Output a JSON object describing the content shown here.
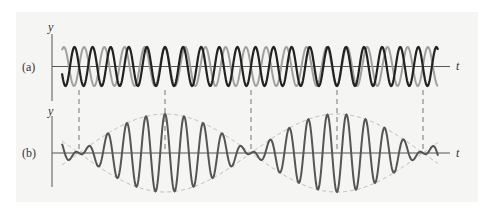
{
  "figure": {
    "panel_a": {
      "label": "(a)",
      "y_axis_label": "y",
      "x_axis_label": "t",
      "description": "Two sinusoidal waves of slightly different frequencies superposed",
      "wave_colors": {
        "wave_1": "#222222",
        "wave_2": "#a0a0a0"
      }
    },
    "panel_b": {
      "label": "(b)",
      "y_axis_label": "y",
      "x_axis_label": "t",
      "description": "Resultant wave showing beats with dashed envelope",
      "wave_color": "#555555",
      "envelope_color": "#b8b8b8"
    },
    "beat_markers": {
      "count": 5,
      "phase_pattern": [
        "out-of-phase",
        "in-phase",
        "out-of-phase",
        "in-phase",
        "out-of-phase"
      ]
    },
    "oscillations_per_beat": 9,
    "amplitude_ratio_b_to_a": 2
  }
}
